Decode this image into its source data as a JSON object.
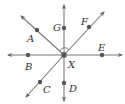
{
  "diagram": {
    "type": "geometry-rays",
    "center": {
      "label": "X",
      "x": 64,
      "y": 55
    },
    "colors": {
      "line": "#777777",
      "point": "#555555",
      "label": "#333333",
      "background": "#ffffff"
    },
    "rays": [
      {
        "name": "ray-XG",
        "to": [
          64,
          5
        ],
        "through": "G"
      },
      {
        "name": "ray-XD",
        "to": [
          64,
          101
        ],
        "through": "D"
      },
      {
        "name": "ray-XE",
        "to": [
          122,
          55
        ],
        "through": "E"
      },
      {
        "name": "ray-XB",
        "to": [
          8,
          55
        ],
        "through": "B"
      },
      {
        "name": "ray-XF",
        "to": [
          104,
          12
        ],
        "through": "F"
      },
      {
        "name": "ray-XA",
        "to": [
          21,
          16
        ],
        "through": "A"
      },
      {
        "name": "ray-XC",
        "to": [
          26,
          97
        ],
        "through": "C"
      }
    ],
    "points": [
      {
        "label": "G",
        "x": 64,
        "y": 28,
        "lx": 53,
        "ly": 31
      },
      {
        "label": "A",
        "x": 37,
        "y": 30,
        "lx": 27,
        "ly": 42
      },
      {
        "label": "F",
        "x": 89,
        "y": 27,
        "lx": 81,
        "ly": 25
      },
      {
        "label": "E",
        "x": 102,
        "y": 55,
        "lx": 98,
        "ly": 51
      },
      {
        "label": "B",
        "x": 28,
        "y": 55,
        "lx": 25,
        "ly": 70
      },
      {
        "label": "C",
        "x": 40,
        "y": 82,
        "lx": 43,
        "ly": 93
      },
      {
        "label": "D",
        "x": 64,
        "y": 83,
        "lx": 69,
        "ly": 92
      }
    ],
    "center_label": {
      "text": "X",
      "x": 68,
      "y": 68
    },
    "angle_marker": {
      "type": "arc",
      "between": [
        "G",
        "F"
      ],
      "radius": 6
    }
  },
  "labels": {
    "G": "G",
    "A": "A",
    "F": "F",
    "E": "E",
    "B": "B",
    "C": "C",
    "D": "D",
    "X": "X"
  }
}
